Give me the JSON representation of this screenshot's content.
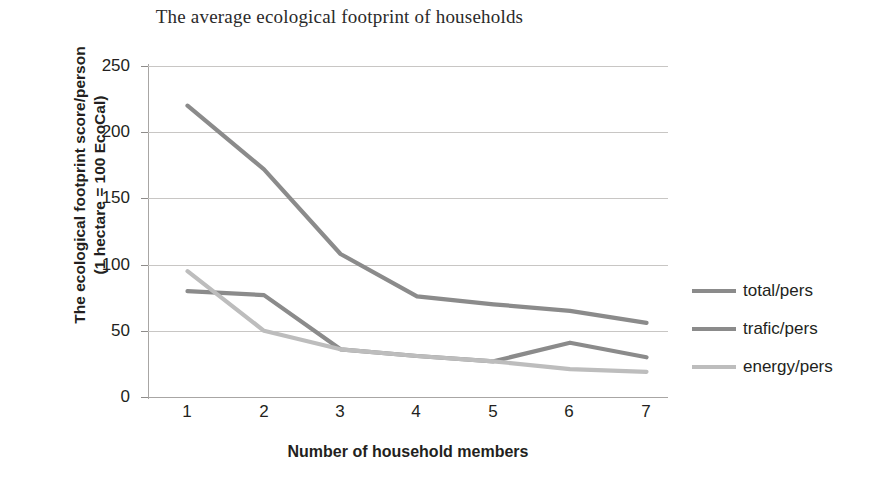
{
  "chart_data": {
    "type": "line",
    "title": "The average ecological footprint of households",
    "xlabel": "Number of household members",
    "ylabel_line1": "The ecological footprint score/person",
    "ylabel_line2": "(1 hectare = 100 EcoCal)",
    "categories": [
      "1",
      "2",
      "3",
      "4",
      "5",
      "6",
      "7"
    ],
    "x": [
      1,
      2,
      3,
      4,
      5,
      6,
      7
    ],
    "xlim": [
      1,
      7
    ],
    "ylim": [
      0,
      250
    ],
    "yticks": [
      "250",
      "200",
      "150",
      "100",
      "50",
      "0"
    ],
    "ytick_values": [
      250,
      200,
      150,
      100,
      50,
      0
    ],
    "grid": "horizontal",
    "legend_position": "right",
    "series": [
      {
        "name": "total/pers",
        "color": "#8b8b8b",
        "values": [
          220,
          172,
          108,
          76,
          70,
          65,
          56
        ]
      },
      {
        "name": "trafic/pers",
        "color": "#8b8b8b",
        "values": [
          80,
          77,
          36,
          31,
          27,
          41,
          30
        ]
      },
      {
        "name": "energy/pers",
        "color": "#bdbdbd",
        "values": [
          95,
          50,
          36,
          31,
          27,
          21,
          19
        ]
      }
    ]
  },
  "legend": {
    "items": [
      {
        "label": "total/pers",
        "color": "#8b8b8b"
      },
      {
        "label": "trafic/pers",
        "color": "#8b8b8b"
      },
      {
        "label": "energy/pers",
        "color": "#bdbdbd"
      }
    ]
  },
  "axes": {
    "y_ticks": [
      "250",
      "200",
      "150",
      "100",
      "50",
      "0"
    ],
    "x_ticks": [
      "1",
      "2",
      "3",
      "4",
      "5",
      "6",
      "7"
    ]
  },
  "colors": {
    "gridline": "#c8c6c4",
    "axis": "#a8a6a4",
    "text": "#231f20"
  }
}
